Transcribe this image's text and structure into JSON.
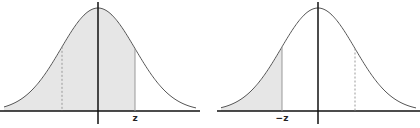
{
  "diagrams": [
    {
      "id": "left",
      "description": "Standard normal curve with area left of z shaded",
      "label": "z",
      "shaded_region": "left-of-z",
      "axis_x": 98,
      "baseline_y": 111,
      "x_start": 0,
      "x_end": 200,
      "solid_line_x": 135,
      "dashed_line_x": 62
    },
    {
      "id": "right",
      "description": "Standard normal curve with area left of -z shaded",
      "label": "−z",
      "shaded_region": "left-of-minus-z",
      "axis_x": 318,
      "baseline_y": 111,
      "x_start": 217,
      "x_end": 420,
      "solid_line_x": 282,
      "dashed_line_x": 355
    }
  ],
  "colors": {
    "curve": "#555555",
    "axis": "#111111",
    "shade": "#e6e6e6",
    "marker": "#999999"
  }
}
